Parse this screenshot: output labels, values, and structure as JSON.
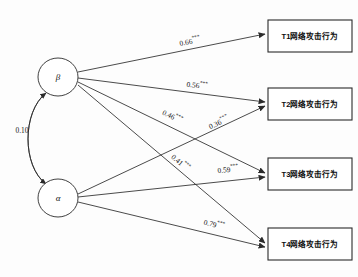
{
  "figure": {
    "type": "path-diagram"
  },
  "latent_nodes": [
    {
      "id": "beta",
      "label": "β",
      "cx": 58,
      "cy": 77,
      "rx": 20,
      "ry": 19
    },
    {
      "id": "alpha",
      "label": "α",
      "cx": 58,
      "cy": 198,
      "rx": 20,
      "ry": 19
    }
  ],
  "observed_nodes": [
    {
      "id": "t1",
      "label": "T1网络攻击行为",
      "x": 268,
      "y": 20,
      "w": 84,
      "h": 32
    },
    {
      "id": "t2",
      "label": "T2网络攻击行为",
      "x": 268,
      "y": 88,
      "w": 84,
      "h": 32
    },
    {
      "id": "t3",
      "label": "T3网络攻击行为",
      "x": 268,
      "y": 158,
      "w": 84,
      "h": 32
    },
    {
      "id": "t4",
      "label": "T4网络攻击行为",
      "x": 268,
      "y": 228,
      "w": 84,
      "h": 32
    }
  ],
  "covariance": {
    "id": "alpha-beta-covariance",
    "value": "0.10",
    "stars": "",
    "label_x": 22,
    "label_y": 131
  },
  "paths": [
    {
      "id": "beta-t1",
      "from": "beta",
      "to": "t1",
      "value": "0.66",
      "stars": "***",
      "x1": 78,
      "y1": 72,
      "x2": 265,
      "y2": 34,
      "label_x": 190,
      "label_y": 42,
      "rotate": -11.5
    },
    {
      "id": "beta-t2",
      "from": "beta",
      "to": "t2",
      "value": "0.56",
      "stars": "***",
      "x1": 78,
      "y1": 78,
      "x2": 265,
      "y2": 102,
      "label_x": 197,
      "label_y": 86,
      "rotate": 7.3
    },
    {
      "id": "beta-t3",
      "from": "beta",
      "to": "t3",
      "value": "0.46",
      "stars": "***",
      "x1": 78,
      "y1": 82,
      "x2": 265,
      "y2": 173,
      "label_x": 172,
      "label_y": 117,
      "rotate": 26.0
    },
    {
      "id": "beta-t4",
      "from": "beta",
      "to": "t4",
      "value": "0.41",
      "stars": "***",
      "x1": 78,
      "y1": 85,
      "x2": 265,
      "y2": 243,
      "label_x": 180,
      "label_y": 163,
      "rotate": 40.2
    },
    {
      "id": "alpha-t1",
      "from": "alpha",
      "to": "t2",
      "value": "0.36",
      "stars": "***",
      "x1": 78,
      "y1": 194,
      "x2": 265,
      "y2": 106,
      "label_x": 219,
      "label_y": 123,
      "rotate": -25.2
    },
    {
      "id": "alpha-t3",
      "from": "alpha",
      "to": "t3",
      "value": "0.59",
      "stars": "***",
      "x1": 78,
      "y1": 197,
      "x2": 265,
      "y2": 177,
      "label_x": 228,
      "label_y": 170,
      "rotate": -6.2
    },
    {
      "id": "alpha-t4",
      "from": "alpha",
      "to": "t4",
      "value": "0.79",
      "stars": "***",
      "x1": 78,
      "y1": 202,
      "x2": 265,
      "y2": 247,
      "label_x": 214,
      "label_y": 225,
      "rotate": 13.6
    }
  ]
}
